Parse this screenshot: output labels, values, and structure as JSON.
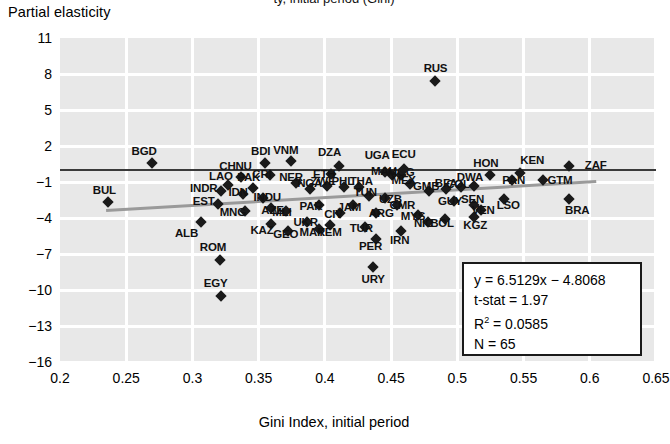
{
  "figure": {
    "top_title_partial": "ty, initial period (Gini)",
    "y_axis_title": "Partial elasticity",
    "x_axis_title": "Gini Index, initial period"
  },
  "stats_box": {
    "equation": "y = 6.5129x − 4.8068",
    "t_stat": "t-stat = 1.97",
    "r_squared_label": "R",
    "r_squared_sup": "2",
    "r_squared_value": " = 0.0585",
    "n": "N = 65"
  },
  "chart_data": {
    "type": "scatter",
    "title": "",
    "xlabel": "Gini Index, initial period",
    "ylabel": "Partial elasticity",
    "xlim": [
      0.2,
      0.65
    ],
    "ylim": [
      -16,
      11
    ],
    "xticks": [
      "0.2",
      "0.25",
      "0.3",
      "0.35",
      "0.4",
      "0.45",
      "0.5",
      "0.55",
      "0.6",
      "0.65"
    ],
    "xtick_values": [
      0.2,
      0.25,
      0.3,
      0.35,
      0.4,
      0.45,
      0.5,
      0.55,
      0.6,
      0.65
    ],
    "yticks": [
      "11",
      "8",
      "5",
      "2",
      "−1",
      "−4",
      "−7",
      "−10",
      "−13",
      "−16"
    ],
    "ytick_values": [
      11,
      8,
      5,
      2,
      -1,
      -4,
      -7,
      -10,
      -13,
      -16
    ],
    "grid": true,
    "legend": "none",
    "reference_line": {
      "type": "horizontal",
      "y": 0.0,
      "color": "#3a3a3a"
    },
    "fit_line": {
      "type": "linear",
      "slope": 6.5129,
      "intercept": -4.8068,
      "x_start": 0.235,
      "x_end": 0.605,
      "color": "#9a9a9a"
    },
    "points": [
      {
        "label": "BGD",
        "x": 0.2695,
        "y": 0.55,
        "lx": 0.2635,
        "ly": 1.55
      },
      {
        "label": "BUL",
        "x": 0.2365,
        "y": -2.7,
        "lx": 0.2335,
        "ly": -1.65
      },
      {
        "label": "ALB",
        "x": 0.3065,
        "y": -4.3,
        "lx": 0.2955,
        "ly": -5.25
      },
      {
        "label": "INDR",
        "x": 0.3215,
        "y": -1.75,
        "lx": 0.3085,
        "ly": -1.5
      },
      {
        "label": "EST",
        "x": 0.3195,
        "y": -2.85,
        "lx": 0.3085,
        "ly": -2.6
      },
      {
        "label": "LAO",
        "x": 0.3265,
        "y": -1.25,
        "lx": 0.3215,
        "ly": -0.5
      },
      {
        "label": "CHNU",
        "x": 0.3365,
        "y": -0.55,
        "lx": 0.3325,
        "ly": 0.3
      },
      {
        "label": "IDN",
        "x": 0.3385,
        "y": -2.0,
        "lx": 0.3345,
        "ly": -1.85
      },
      {
        "label": "MNG",
        "x": 0.3395,
        "y": -3.4,
        "lx": 0.3305,
        "ly": -3.5
      },
      {
        "label": "PAK",
        "x": 0.3455,
        "y": -1.5,
        "lx": 0.3425,
        "ly": -0.6
      },
      {
        "label": "ROM",
        "x": 0.3205,
        "y": -7.5,
        "lx": 0.3155,
        "ly": -6.45
      },
      {
        "label": "EGY",
        "x": 0.3215,
        "y": -10.5,
        "lx": 0.3175,
        "ly": -9.4
      },
      {
        "label": "INDU",
        "x": 0.3535,
        "y": -2.3,
        "lx": 0.3565,
        "ly": -2.25
      },
      {
        "label": "CRI",
        "x": 0.3585,
        "y": -0.45,
        "lx": 0.3525,
        "ly": -0.35
      },
      {
        "label": "AZE",
        "x": 0.3595,
        "y": -3.2,
        "lx": 0.3605,
        "ly": -3.3
      },
      {
        "label": "BDI",
        "x": 0.3545,
        "y": 0.55,
        "lx": 0.3515,
        "ly": 1.55
      },
      {
        "label": "KAZ",
        "x": 0.3595,
        "y": -4.5,
        "lx": 0.3525,
        "ly": -5.0
      },
      {
        "label": "MLI",
        "x": 0.3705,
        "y": -3.4,
        "lx": 0.3675,
        "ly": -3.5
      },
      {
        "label": "VNM",
        "x": 0.3745,
        "y": 0.75,
        "lx": 0.3705,
        "ly": 1.7
      },
      {
        "label": "NER",
        "x": 0.3785,
        "y": -1.05,
        "lx": 0.3745,
        "ly": -0.6
      },
      {
        "label": "GEO",
        "x": 0.3725,
        "y": -5.1,
        "lx": 0.3705,
        "ly": -5.3
      },
      {
        "label": "UKR",
        "x": 0.3865,
        "y": -4.3,
        "lx": 0.3855,
        "ly": -4.35
      },
      {
        "label": "NGA",
        "x": 0.3885,
        "y": -1.6,
        "lx": 0.3885,
        "ly": -1.1
      },
      {
        "label": "PAR",
        "x": 0.3955,
        "y": -2.9,
        "lx": 0.3895,
        "ly": -3.0
      },
      {
        "label": "MAR",
        "x": 0.3955,
        "y": -4.9,
        "lx": 0.3905,
        "ly": -5.2
      },
      {
        "label": "ZWE",
        "x": 0.4015,
        "y": -1.35,
        "lx": 0.3985,
        "ly": -0.95
      },
      {
        "label": "ETH",
        "x": 0.4045,
        "y": -0.3,
        "lx": 0.3995,
        "ly": -0.3
      },
      {
        "label": "YEM",
        "x": 0.4035,
        "y": -4.55,
        "lx": 0.4035,
        "ly": -5.15
      },
      {
        "label": "CIV",
        "x": 0.4115,
        "y": -3.55,
        "lx": 0.4065,
        "ly": -3.7
      },
      {
        "label": "DZA",
        "x": 0.4105,
        "y": 0.35,
        "lx": 0.4035,
        "ly": 1.5
      },
      {
        "label": "PHL",
        "x": 0.4145,
        "y": -1.45,
        "lx": 0.4135,
        "ly": -0.95
      },
      {
        "label": "JAM",
        "x": 0.4215,
        "y": -2.95,
        "lx": 0.4185,
        "ly": -3.05
      },
      {
        "label": "THA",
        "x": 0.4255,
        "y": -1.4,
        "lx": 0.4275,
        "ly": -0.95
      },
      {
        "label": "TUR",
        "x": 0.4305,
        "y": -4.75,
        "lx": 0.4275,
        "ly": -4.8
      },
      {
        "label": "TUN",
        "x": 0.4335,
        "y": -2.15,
        "lx": 0.4305,
        "ly": -1.85
      },
      {
        "label": "PER",
        "x": 0.4385,
        "y": -5.75,
        "lx": 0.4345,
        "ly": -6.35
      },
      {
        "label": "ARG",
        "x": 0.4385,
        "y": -3.6,
        "lx": 0.4425,
        "ly": -3.55
      },
      {
        "label": "URY",
        "x": 0.4365,
        "y": -8.05,
        "lx": 0.4365,
        "ly": -9.05
      },
      {
        "label": "UZB",
        "x": 0.4455,
        "y": -2.35,
        "lx": 0.4495,
        "ly": -2.4
      },
      {
        "label": "UGA",
        "x": 0.4455,
        "y": -0.15,
        "lx": 0.4395,
        "ly": 1.25
      },
      {
        "label": "MAU",
        "x": 0.4505,
        "y": -0.45,
        "lx": 0.4445,
        "ly": -0.1
      },
      {
        "label": "MOG",
        "x": 0.4575,
        "y": -0.4,
        "lx": 0.4575,
        "ly": -0.15
      },
      {
        "label": "CMR",
        "x": 0.4545,
        "y": -2.9,
        "lx": 0.4585,
        "ly": -2.95
      },
      {
        "label": "ECU",
        "x": 0.4595,
        "y": 0.05,
        "lx": 0.4595,
        "ly": 1.3
      },
      {
        "label": "IRN",
        "x": 0.4575,
        "y": -5.1,
        "lx": 0.4565,
        "ly": -5.8
      },
      {
        "label": "MEX",
        "x": 0.4645,
        "y": -1.2,
        "lx": 0.4595,
        "ly": -0.85
      },
      {
        "label": "RUS",
        "x": 0.4835,
        "y": 7.4,
        "lx": 0.4835,
        "ly": 8.5
      },
      {
        "label": "MYS",
        "x": 0.4705,
        "y": -3.75,
        "lx": 0.4665,
        "ly": -3.85
      },
      {
        "label": "GMB",
        "x": 0.4785,
        "y": -1.75,
        "lx": 0.4765,
        "ly": -1.3
      },
      {
        "label": "NIC",
        "x": 0.4775,
        "y": -4.35,
        "lx": 0.4745,
        "ly": -4.4
      },
      {
        "label": "BFA",
        "x": 0.4915,
        "y": -1.6,
        "lx": 0.4915,
        "ly": -1.1
      },
      {
        "label": "BOL",
        "x": 0.4905,
        "y": -4.05,
        "lx": 0.4885,
        "ly": -4.4
      },
      {
        "label": "GUY",
        "x": 0.4975,
        "y": -2.55,
        "lx": 0.4945,
        "ly": -2.6
      },
      {
        "label": "COL",
        "x": 0.5025,
        "y": -1.45,
        "lx": 0.5005,
        "ly": -1.15
      },
      {
        "label": "DWA",
        "x": 0.5125,
        "y": -1.3,
        "lx": 0.5095,
        "ly": -0.55
      },
      {
        "label": "SEN",
        "x": 0.5125,
        "y": -2.9,
        "lx": 0.5115,
        "ly": -2.4
      },
      {
        "label": "KGZ",
        "x": 0.5125,
        "y": -3.9,
        "lx": 0.5135,
        "ly": -4.6
      },
      {
        "label": "VEN",
        "x": 0.5175,
        "y": -3.35,
        "lx": 0.5195,
        "ly": -3.3
      },
      {
        "label": "HON",
        "x": 0.5245,
        "y": -0.45,
        "lx": 0.5215,
        "ly": 0.6
      },
      {
        "label": "LSO",
        "x": 0.5355,
        "y": -2.45,
        "lx": 0.5385,
        "ly": -2.9
      },
      {
        "label": "PAN",
        "x": 0.5415,
        "y": -0.85,
        "lx": 0.5425,
        "ly": -0.8
      },
      {
        "label": "KEN",
        "x": 0.5475,
        "y": -0.25,
        "lx": 0.5565,
        "ly": 0.85
      },
      {
        "label": "GTM",
        "x": 0.5645,
        "y": -0.85,
        "lx": 0.5775,
        "ly": -0.85
      },
      {
        "label": "ZAF",
        "x": 0.5845,
        "y": 0.35,
        "lx": 0.6045,
        "ly": 0.4
      },
      {
        "label": "BRA",
        "x": 0.5845,
        "y": -2.45,
        "lx": 0.5905,
        "ly": -3.3
      }
    ]
  }
}
